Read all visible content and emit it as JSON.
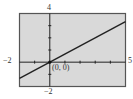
{
  "chart_data": {
    "type": "line",
    "title": "",
    "xlabel": "",
    "ylabel": "",
    "xlim": [
      -2,
      5
    ],
    "ylim": [
      -2,
      4
    ],
    "grid": false,
    "series": [
      {
        "name": "line",
        "equation": "y = (2/3)x",
        "x": [
          -2,
          5
        ],
        "y": [
          -1.333,
          3.333
        ]
      }
    ],
    "annotations": [
      {
        "text": "(0, 0)",
        "x": 0,
        "y": 0
      }
    ],
    "tick_labels": {
      "x_min": "−2",
      "x_max": "5",
      "y_min": "−2",
      "y_max": "4"
    },
    "x_ticks": [
      -1,
      1,
      2,
      3,
      4
    ],
    "y_ticks": [
      -1,
      1,
      2,
      3
    ]
  },
  "colors": {
    "screen": "#d9d9d9",
    "frame": "#444444",
    "axis": "#222222",
    "line": "#222222"
  }
}
